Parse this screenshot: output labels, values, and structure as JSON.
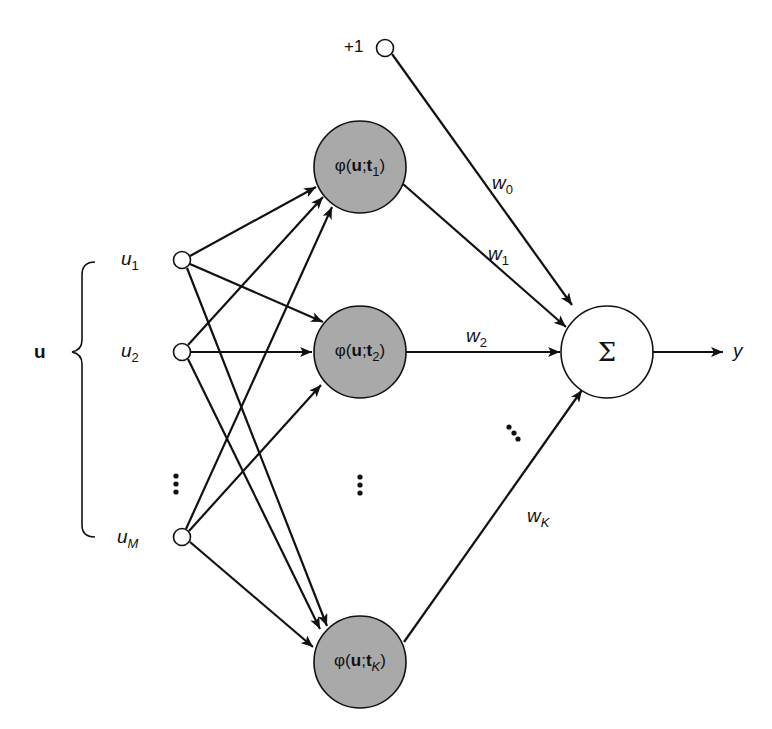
{
  "diagram": {
    "bias": {
      "label": "+1"
    },
    "input_vector_label": "u",
    "inputs": [
      {
        "name": "u",
        "sub": "1"
      },
      {
        "name": "u",
        "sub": "2"
      },
      {
        "name": "u",
        "sub": "M"
      }
    ],
    "hidden": [
      {
        "phi": "φ(",
        "u": "u",
        "sep": ";",
        "t": "t",
        "sub": "1",
        "close": ")"
      },
      {
        "phi": "φ(",
        "u": "u",
        "sep": ";",
        "t": "t",
        "sub": "2",
        "close": ")"
      },
      {
        "phi": "φ(",
        "u": "u",
        "sep": ";",
        "t": "t",
        "sub": "K",
        "close": ")"
      }
    ],
    "weights": [
      {
        "name": "w",
        "sub": "0"
      },
      {
        "name": "w",
        "sub": "1"
      },
      {
        "name": "w",
        "sub": "2"
      },
      {
        "name": "w",
        "sub": "K"
      }
    ],
    "sum_symbol": "Σ",
    "output_label": "y",
    "ellipsis": "⋮",
    "colors": {
      "hidden_fill": "#a9a9a9",
      "stroke": "#111111",
      "node_fill": "#ffffff"
    }
  }
}
